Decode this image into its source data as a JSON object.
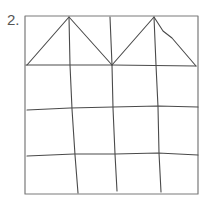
{
  "figure": {
    "label": "2.",
    "colors": {
      "stroke": "#4a4a4a",
      "frame": "#7a7a7a",
      "label": "#555555",
      "background": "#ffffff"
    }
  }
}
